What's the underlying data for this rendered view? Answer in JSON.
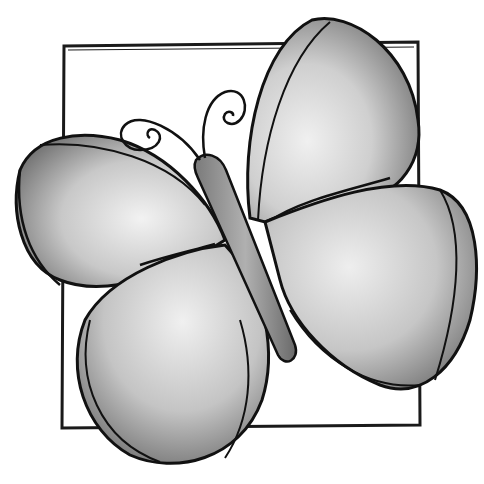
{
  "image": {
    "subject": "Butterfly illustration inside a square frame",
    "style": "grayscale watercolor with black ink outlines",
    "colors": {
      "background": "#ffffff",
      "outline": "#111111",
      "wing_light": "#e6e6e6",
      "wing_mid": "#b5b5b5",
      "wing_dark": "#7a7a7a",
      "body": "#9a9a9a",
      "frame": "#1a1a1a"
    }
  }
}
